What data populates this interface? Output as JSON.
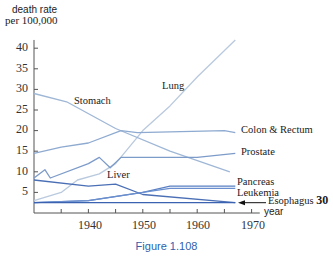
{
  "chart_data": {
    "type": "line",
    "title": "",
    "caption": "Figure 1.108",
    "ylabel_line1": "death rate",
    "ylabel_line2": "per 100,000",
    "xlabel": "year",
    "xlim": [
      1930,
      1972
    ],
    "ylim": [
      0,
      42
    ],
    "y_ticks": [
      5,
      10,
      15,
      20,
      25,
      30,
      35,
      40
    ],
    "x_tick_labels": [
      1940,
      1950,
      1960,
      1970
    ],
    "x_minor_ticks": [
      1935,
      1940,
      1945,
      1950,
      1955,
      1960,
      1965,
      1970
    ],
    "grid": false,
    "legend": "inline labels",
    "series": [
      {
        "name": "Lung",
        "color": "#b9c9de",
        "x": [
          1930,
          1935,
          1938,
          1942,
          1945,
          1950,
          1955,
          1960,
          1967
        ],
        "values": [
          3,
          5,
          8,
          9.5,
          12,
          20,
          26,
          33,
          42
        ]
      },
      {
        "name": "Stomach",
        "color": "#9fb7d6",
        "x": [
          1930,
          1936,
          1945,
          1955,
          1966
        ],
        "values": [
          29,
          27,
          20.5,
          15,
          10
        ]
      },
      {
        "name": "Colon & Rectum",
        "color": "#8eaad0",
        "x": [
          1930,
          1935,
          1940,
          1946,
          1949,
          1965,
          1967
        ],
        "values": [
          14.5,
          16,
          17,
          20,
          19.5,
          20,
          19.5
        ]
      },
      {
        "name": "Prostate",
        "color": "#7d9bc9",
        "x": [
          1930,
          1932,
          1933,
          1940,
          1942,
          1944,
          1946,
          1950,
          1960,
          1967
        ],
        "values": [
          8.5,
          10.5,
          8.5,
          12,
          13.5,
          11,
          13.5,
          13.5,
          13.5,
          14.5
        ]
      },
      {
        "name": "Liver",
        "color": "#4b6fb5",
        "x": [
          1930,
          1940,
          1945,
          1950,
          1967
        ],
        "values": [
          8,
          6.5,
          7,
          4.5,
          2.5
        ]
      },
      {
        "name": "Pancreas",
        "color": "#5a80c4",
        "x": [
          1930,
          1940,
          1950,
          1955,
          1967
        ],
        "values": [
          2.5,
          3,
          5,
          6.5,
          6.5
        ]
      },
      {
        "name": "Leukemia",
        "color": "#6b8fce",
        "x": [
          1930,
          1940,
          1950,
          1955,
          1967
        ],
        "values": [
          2.5,
          3,
          5,
          6,
          6
        ]
      },
      {
        "name": "Esophagus",
        "color": "#3a62b0",
        "x": [
          1930,
          1967
        ],
        "values": [
          2.5,
          2.5
        ]
      }
    ],
    "annotations": [
      {
        "text": "Esophagus",
        "bold_suffix": "30",
        "arrow": "left",
        "at_year": 1967,
        "at_value": 2.5
      }
    ]
  },
  "labels": {
    "stomach": "Stomach",
    "lung": "Lung",
    "colon": "Colon & Rectum",
    "prostate": "Prostate",
    "liver": "Liver",
    "pancreas": "Pancreas",
    "leukemia": "Leukemia",
    "esophagus": "Esophagus",
    "esophagus_num": "30",
    "year": "year",
    "caption": "Figure 1.108",
    "ylabel1": "death rate",
    "ylabel2": "per 100,000"
  },
  "yticks": [
    "40",
    "35",
    "30",
    "25",
    "20",
    "15",
    "10",
    "5"
  ],
  "xticks": [
    "1940",
    "1950",
    "1960",
    "1970"
  ]
}
